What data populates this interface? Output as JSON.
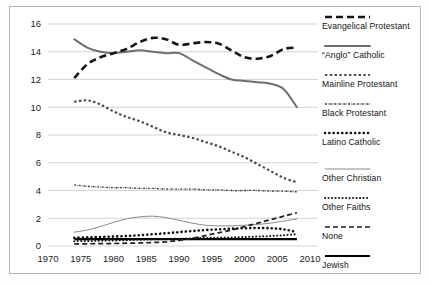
{
  "chart_data": {
    "type": "line",
    "title": "",
    "xlabel": "",
    "ylabel": "",
    "xlim": [
      1970,
      2010
    ],
    "ylim": [
      0,
      16
    ],
    "grid": true,
    "legend_position": "right",
    "x_ticks": [
      "1970",
      "1975",
      "1980",
      "1985",
      "1990",
      "1995",
      "2000",
      "2005",
      "2010"
    ],
    "y_ticks": [
      "0",
      "2",
      "4",
      "6",
      "8",
      "10",
      "12",
      "14",
      "16"
    ],
    "x": [
      1974,
      1976,
      1978,
      1980,
      1982,
      1984,
      1986,
      1988,
      1990,
      1992,
      1994,
      1996,
      1998,
      2000,
      2002,
      2004,
      2006,
      2008
    ],
    "series": [
      {
        "name": "Evangelical Protestant",
        "style": "thick-dash",
        "color": "#161616",
        "values": [
          12.1,
          13.1,
          13.6,
          13.9,
          14.2,
          14.7,
          15.0,
          14.9,
          14.5,
          14.6,
          14.7,
          14.6,
          14.1,
          13.6,
          13.5,
          13.7,
          14.2,
          14.3
        ]
      },
      {
        "name": "“Anglo” Catholic",
        "style": "medium-solid-gray",
        "color": "#6e6e6e",
        "values": [
          14.9,
          14.3,
          14.0,
          13.9,
          14.0,
          14.1,
          14.0,
          13.9,
          13.9,
          13.4,
          12.9,
          12.4,
          12.0,
          11.9,
          11.8,
          11.7,
          11.3,
          10.0
        ]
      },
      {
        "name": "Mainline Protestant",
        "style": "dotted-medium",
        "color": "#4b4b4b",
        "values": [
          10.4,
          10.5,
          10.2,
          9.7,
          9.3,
          9.0,
          8.6,
          8.2,
          8.0,
          7.8,
          7.5,
          7.2,
          6.8,
          6.4,
          5.9,
          5.4,
          4.9,
          4.6
        ]
      },
      {
        "name": "Black Protestant",
        "style": "fine-dashdot",
        "color": "#3a3a3a",
        "values": [
          4.4,
          4.3,
          4.25,
          4.2,
          4.2,
          4.15,
          4.15,
          4.1,
          4.1,
          4.1,
          4.05,
          4.05,
          4.0,
          4.0,
          4.0,
          3.95,
          3.95,
          3.9
        ]
      },
      {
        "name": "Latino Catholic",
        "style": "chunky-dots",
        "color": "#111111",
        "values": [
          0.6,
          0.62,
          0.65,
          0.68,
          0.72,
          0.78,
          0.85,
          0.92,
          1.0,
          1.08,
          1.15,
          1.2,
          1.25,
          1.28,
          1.3,
          1.28,
          1.2,
          1.0
        ]
      },
      {
        "name": "Other Christian",
        "style": "thin-solid-gray",
        "color": "#8a8a8a",
        "values": [
          1.0,
          1.15,
          1.4,
          1.7,
          1.95,
          2.1,
          2.15,
          2.05,
          1.85,
          1.65,
          1.5,
          1.45,
          1.45,
          1.5,
          1.55,
          1.65,
          1.8,
          1.95
        ]
      },
      {
        "name": "Other Faiths",
        "style": "round-dots",
        "color": "#141414",
        "values": [
          0.35,
          0.36,
          0.38,
          0.4,
          0.42,
          0.45,
          0.48,
          0.5,
          0.52,
          0.55,
          0.58,
          0.6,
          0.62,
          0.65,
          0.68,
          0.72,
          0.78,
          0.85
        ]
      },
      {
        "name": "None",
        "style": "long-dash",
        "color": "#202020",
        "values": [
          0.15,
          0.16,
          0.17,
          0.18,
          0.2,
          0.22,
          0.25,
          0.3,
          0.4,
          0.55,
          0.75,
          0.95,
          1.15,
          1.4,
          1.65,
          1.9,
          2.15,
          2.4
        ]
      },
      {
        "name": "Jewish",
        "style": "thick-solid-black",
        "color": "#000000",
        "values": [
          0.5,
          0.5,
          0.5,
          0.5,
          0.5,
          0.5,
          0.5,
          0.5,
          0.5,
          0.5,
          0.5,
          0.5,
          0.5,
          0.5,
          0.5,
          0.5,
          0.5,
          0.5
        ]
      }
    ]
  },
  "legend": {
    "items": [
      {
        "label": "Evangelical Protestant",
        "key": "thick-dash"
      },
      {
        "label": "“Anglo” Catholic",
        "key": "medium-solid-gray"
      },
      {
        "label": "Mainline Protestant",
        "key": "dotted-medium"
      },
      {
        "label": "Black Protestant",
        "key": "fine-dashdot"
      },
      {
        "label": "Latino Catholic",
        "key": "chunky-dots"
      },
      {
        "label": "Other Christian",
        "key": "thin-solid-gray"
      },
      {
        "label": "Other Faiths",
        "key": "round-dots"
      },
      {
        "label": "None",
        "key": "long-dash"
      },
      {
        "label": "Jewish",
        "key": "thick-solid-black"
      }
    ]
  },
  "colors": {
    "grid": "#c8c8c8",
    "frame": "#b9b9b9",
    "text": "#1a1a1a",
    "background": "#ffffff"
  }
}
